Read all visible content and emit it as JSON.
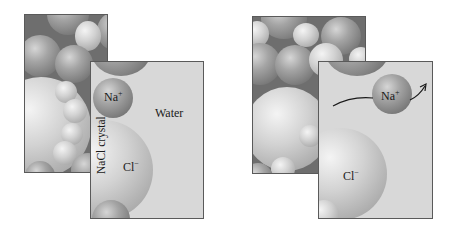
{
  "figure": {
    "left": {
      "crystal_label": "NaCl crystal",
      "water_label": "Water",
      "na_label": "Na",
      "na_charge": "+",
      "cl_label": "Cl",
      "cl_charge": "−"
    },
    "right": {
      "na_label": "Na",
      "na_charge": "+",
      "cl_label": "Cl",
      "cl_charge": "−",
      "arrow": "curved-arrow-outward"
    }
  },
  "colors": {
    "water": "#d8d8d8",
    "crystal_background": "#6e6e6e",
    "border": "#5a5a5a"
  }
}
